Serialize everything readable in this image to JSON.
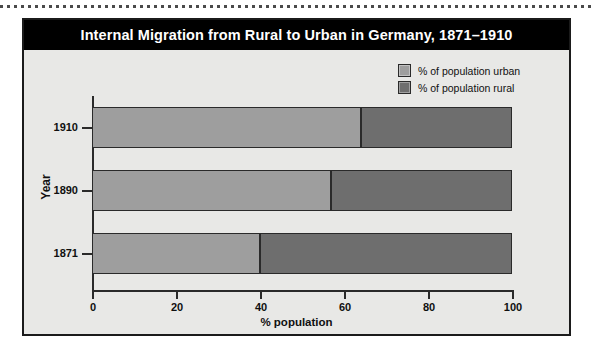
{
  "chart_data": {
    "type": "bar",
    "orientation": "horizontal",
    "stacked": true,
    "title": "Internal Migration from Rural to Urban in Germany, 1871–1910",
    "xlabel": "% population",
    "ylabel": "Year",
    "categories": [
      "1871",
      "1890",
      "1910"
    ],
    "xlim": [
      0,
      100
    ],
    "xticks": [
      "0",
      "20",
      "40",
      "60",
      "80",
      "100"
    ],
    "xtick_values": [
      0,
      20,
      40,
      60,
      80,
      100
    ],
    "grid": false,
    "legend_position": "top-right",
    "series": [
      {
        "name": "% of population urban",
        "color": "#9e9e9e",
        "values": [
          40,
          57,
          64
        ]
      },
      {
        "name": "% of population rural",
        "color": "#6e6e6e",
        "values": [
          60,
          43,
          36
        ]
      }
    ]
  },
  "figure": {
    "title": "Internal Migration from Rural to Urban in Germany, 1871–1910",
    "title_background": "#000000",
    "title_color": "#ffffff",
    "panel_background": "#e8e8e6",
    "border_color": "#1b1b1b"
  },
  "legend": {
    "items": [
      {
        "label": "% of population urban",
        "color": "#9e9e9e"
      },
      {
        "label": "% of population rural",
        "color": "#6e6e6e"
      }
    ]
  },
  "axes": {
    "x_title": "% population",
    "y_title": "Year",
    "x_ticks": [
      "0",
      "20",
      "40",
      "60",
      "80",
      "100"
    ],
    "y_ticks": [
      "1910",
      "1890",
      "1871"
    ]
  }
}
